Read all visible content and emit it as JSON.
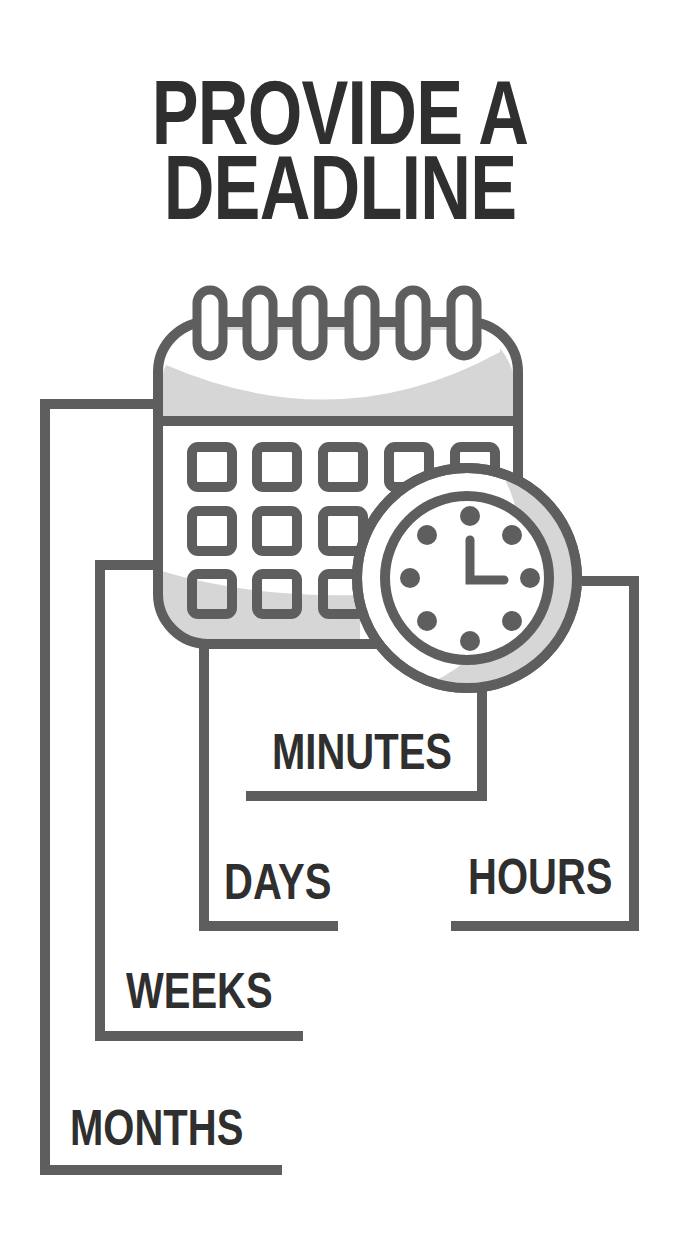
{
  "title": {
    "line1": "PROVIDE A",
    "line2": "DEADLINE"
  },
  "icons": {
    "calendar": "calendar-icon",
    "clock": "clock-icon"
  },
  "labels": {
    "minutes": "MINUTES",
    "days": "DAYS",
    "hours": "HOURS",
    "weeks": "WEEKS",
    "months": "MONTHS"
  },
  "colors": {
    "stroke": "#5e5e5e",
    "text": "#2f2f2f",
    "shade": "#d6d6d6",
    "background": "#ffffff"
  }
}
